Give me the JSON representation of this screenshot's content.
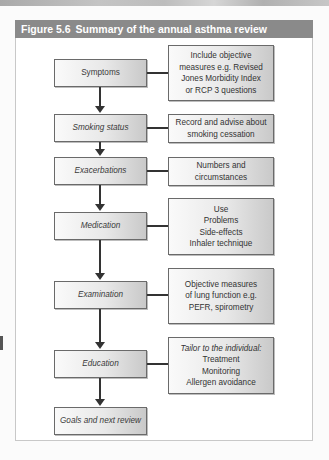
{
  "figure": {
    "number": "Figure 5.6",
    "title": "Summary of the annual asthma review"
  },
  "flow": [
    {
      "step": "Symptoms",
      "italic": false,
      "details": [
        "Include objective",
        "measures e.g. Revised",
        "Jones Morbidity Index",
        "or RCP 3 questions"
      ]
    },
    {
      "step": "Smoking status",
      "italic": true,
      "details": [
        "Record and advise about",
        "smoking cessation"
      ]
    },
    {
      "step": "Exacerbations",
      "italic": true,
      "details": [
        "Numbers and",
        "circumstances"
      ]
    },
    {
      "step": "Medication",
      "italic": true,
      "details": [
        "Use",
        "Problems",
        "Side-effects",
        "Inhaler technique"
      ]
    },
    {
      "step": "Examination",
      "italic": true,
      "details": [
        "Objective measures",
        "of lung function e.g.",
        "PEFR, spirometry"
      ]
    },
    {
      "step": "Education",
      "italic": true,
      "details_heading": "Tailor to the individual:",
      "details": [
        "Treatment",
        "Monitoring",
        "Allergen avoidance"
      ]
    },
    {
      "step": "Goals and next review",
      "italic": true,
      "details": []
    }
  ],
  "colors": {
    "header_bg": "#8a8a8a",
    "header_text": "#ffffff",
    "box_border": "#6a6a6a",
    "connector": "#333333"
  }
}
